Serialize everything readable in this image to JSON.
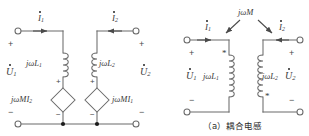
{
  "figure": {
    "caption": "（a）耦合电感",
    "panels": [
      "equivalent-dependent-source-model",
      "coupled-inductor-symbol"
    ]
  },
  "left_circuit": {
    "name": "dependent-source-equivalent",
    "currents": [
      {
        "id": "i1",
        "label": "I",
        "sub": "1",
        "dot": true,
        "direction": "right"
      },
      {
        "id": "i2",
        "label": "I",
        "sub": "2",
        "dot": true,
        "direction": "left"
      }
    ],
    "voltages": [
      {
        "id": "u1",
        "label": "U",
        "sub": "1",
        "dot": true,
        "plus": "+",
        "minus": "−"
      },
      {
        "id": "u2",
        "label": "U",
        "sub": "2",
        "dot": true,
        "plus": "+",
        "minus": "−"
      }
    ],
    "inductors": [
      {
        "id": "L1",
        "label": "jωL",
        "sub": "1"
      },
      {
        "id": "L2",
        "label": "jωL",
        "sub": "2"
      }
    ],
    "dependent_sources": [
      {
        "id": "src1",
        "label": "jωMI",
        "sub": "2",
        "dot": true,
        "shape": "diamond",
        "plus": "+",
        "minus": "−"
      },
      {
        "id": "src2",
        "label": "jωMI",
        "sub": "1",
        "dot": true,
        "shape": "diamond",
        "plus": "+",
        "minus": "−"
      }
    ]
  },
  "right_circuit": {
    "name": "coupled-inductor-symbol",
    "mutual": {
      "id": "M",
      "label": "jωM",
      "arrows": 2
    },
    "currents": [
      {
        "id": "i1",
        "label": "I",
        "sub": "1",
        "dot": true,
        "direction": "right"
      },
      {
        "id": "i2",
        "label": "I",
        "sub": "2",
        "dot": true,
        "direction": "left"
      }
    ],
    "voltages": [
      {
        "id": "u1",
        "label": "U",
        "sub": "1",
        "dot": true,
        "plus": "+",
        "minus": "−"
      },
      {
        "id": "u2",
        "label": "U",
        "sub": "2",
        "dot": true,
        "plus": "+",
        "minus": "−"
      }
    ],
    "inductors": [
      {
        "id": "L1",
        "label": "jωL",
        "sub": "1",
        "dot_mark": "*",
        "dot_position": "top"
      },
      {
        "id": "L2",
        "label": "jωL",
        "sub": "2",
        "dot_mark": "*",
        "dot_position": "bottom"
      }
    ]
  },
  "colors": {
    "wire": "#6b6b6b",
    "text": "#3a3a3a",
    "caption": "#2b2b2b",
    "background": "#ffffff",
    "node": "#1a1a1a"
  }
}
